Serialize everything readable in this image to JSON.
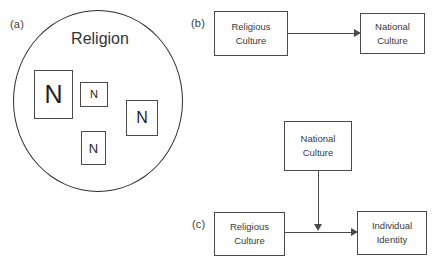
{
  "figure": {
    "panels": [
      {
        "key": "a",
        "label": "(a)",
        "title": "Religion",
        "nodes": [
          {
            "label": "N",
            "size": "large"
          },
          {
            "label": "N",
            "size": "x-small"
          },
          {
            "label": "N",
            "size": "medium"
          },
          {
            "label": "N",
            "size": "small"
          }
        ]
      },
      {
        "key": "b",
        "label": "(b)",
        "boxes": [
          {
            "line1": "Religious",
            "line2": "Culture"
          },
          {
            "line1": "National",
            "line2": "Culture"
          }
        ],
        "arrows": [
          {
            "from": "Religious Culture",
            "to": "National Culture",
            "direction": "right"
          }
        ]
      },
      {
        "key": "c",
        "label": "(c)",
        "boxes": [
          {
            "line1": "National",
            "line2": "Culture"
          },
          {
            "line1": "Religious",
            "line2": "Culture"
          },
          {
            "line1": "Individual",
            "line2": "Identity"
          }
        ],
        "arrows": [
          {
            "from": "National Culture",
            "to": "Individual Identity",
            "direction": "down"
          },
          {
            "from": "Religious Culture",
            "to": "Individual Identity",
            "direction": "right"
          }
        ]
      }
    ]
  },
  "colors": {
    "background": "#ffffff",
    "stroke": "#4a4a4a",
    "circle_stroke": "#2e2e2e",
    "text": "#3a3a3a"
  }
}
